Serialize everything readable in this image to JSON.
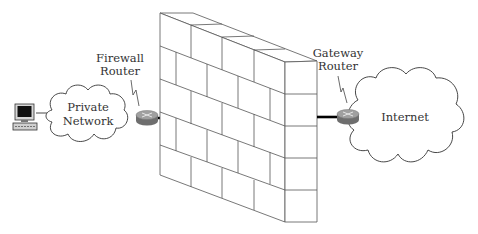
{
  "diagram": {
    "nodes": {
      "workstation": {
        "label": "",
        "icon": "computer-workstation-icon"
      },
      "private_network": {
        "line1": "Private",
        "line2": "Network",
        "icon": "cloud-icon"
      },
      "firewall_router": {
        "line1": "Firewall",
        "line2": "Router",
        "icon": "router-icon"
      },
      "firewall": {
        "label": "",
        "icon": "brick-wall-icon"
      },
      "gateway_router": {
        "line1": "Gateway",
        "line2": "Router",
        "icon": "router-icon"
      },
      "internet": {
        "label": "Internet",
        "icon": "cloud-icon"
      }
    },
    "edges": [
      {
        "from": "workstation",
        "to": "private_network",
        "style": "thin"
      },
      {
        "from": "private_network",
        "to": "firewall_router",
        "style": "thin"
      },
      {
        "from": "firewall_router",
        "to": "firewall",
        "style": "thick"
      },
      {
        "from": "firewall",
        "to": "gateway_router",
        "style": "thick"
      },
      {
        "from": "gateway_router",
        "to": "internet",
        "style": "thin"
      }
    ],
    "colors": {
      "line": "#000000",
      "outline": "#444444",
      "router_top": "#9a9a9a",
      "router_side": "#6e6e6e",
      "text": "#333333"
    }
  }
}
